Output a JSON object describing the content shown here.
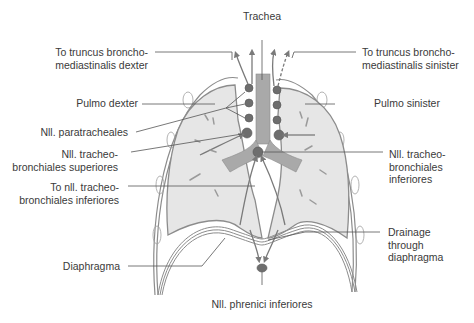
{
  "figure": {
    "type": "anatomical-diagram",
    "colors": {
      "lung_fill": "#e6e6e6",
      "outline": "#8c8c8c",
      "trachea": "#a9a9a9",
      "node": "#6e6e6e",
      "leader_line": "#555555",
      "text": "#3a3a3a"
    }
  },
  "labels": {
    "trachea": "Trachea",
    "truncus_dexter": "To truncus broncho-\nmediastinalis dexter",
    "truncus_sinister": "To truncus broncho-\nmediastinalis sinister",
    "pulmo_dexter": "Pulmo dexter",
    "pulmo_sinister": "Pulmo sinister",
    "paratracheales": "Nll. paratracheales",
    "tb_superiores": "Nll. tracheo-\nbronchiales superiores",
    "tb_inferiores_right": "Nll. tracheo-\nbronchiales\ninferiores",
    "to_tb_inferiores": "To nll. tracheo-\nbronchiales inferiores",
    "drainage": "Drainage\nthrough\ndiaphragma",
    "diaphragma": "Diaphragma",
    "phrenici": "Nll. phrenici inferiores"
  }
}
